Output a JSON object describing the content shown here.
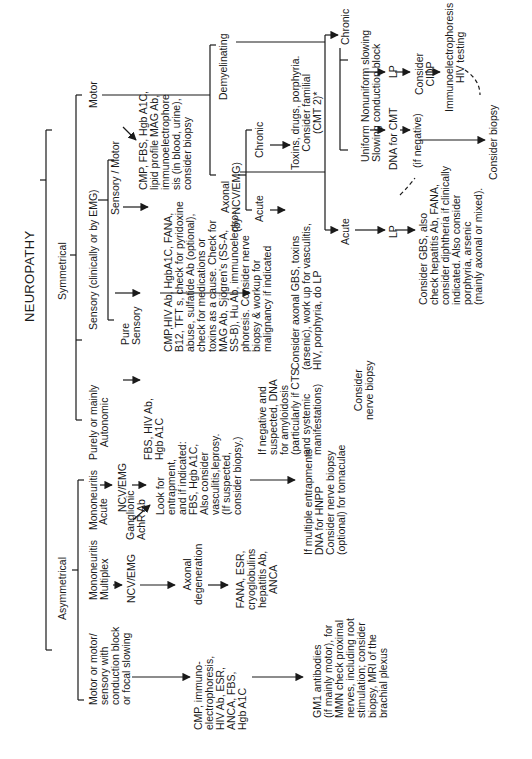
{
  "diagram": {
    "title": "NEUROPATHY",
    "branches": {
      "symmetrical": "Symmetrical",
      "asymmetrical": "Asymmetrical"
    },
    "symmetrical": {
      "motor": "Motor",
      "sensory": "Sensory (clinically or by EMG)",
      "autonomic": "Purely or mainly\nAutonomic",
      "sensory_motor": "Sensory / Motor",
      "pure_sensory": "Pure\nSensory",
      "sensory_motor_workup": "CMP, FBS, Hgb A1C,\nlipid profile MAG Ab,\nimmunoelectrophore\nsis (in blood, urine),\nconsider biopsy",
      "pure_sensory_workup": "CMP,HIV Ab, HgbA1C, FANA,\nB12, TFT s, check for pyridoxine\nabuse, sulfatide Ab (optional),\ncheck for medications or\ntoxins as a cause. Check for\nMAG Ab, Sjögren's (SS-A,\nSS-B), Hu Ab, immunoelectro-\nphoresis. Consider nerve\nbiopsy & workup for\nmalignancy if indicated",
      "autonomic_acute": "Acute",
      "ganglionic": "Ganglionic\nAchR Ab",
      "autonomic_workup": "FBS, HIV Ab,\nHgb A1C",
      "amyloid": "If negative and\nsuspected, DNA\nfor amyloidosis\n(particularly if CTS\nand systemic\nmanifestations)",
      "nerve_biopsy": "Consider\nnerve biopsy",
      "demyelinating": "Demyelinating",
      "axonal": "Axonal\n(by NCV/EMG)",
      "axonal_acute": "Acute",
      "axonal_chronic": "Chronic",
      "axonal_acute_workup": "Consider axonal GBS, toxins\n(arsenic), work up for vasculitis,\nHIV, porphyria, do LP",
      "axonal_chronic_workup": "Toxins, drugs, porphyria.\nConsider familial\n(CMT 2)*",
      "demy_chronic": "Chronic",
      "demy_acute": "Acute",
      "uniform_slowing": "Uniform\nSlowing",
      "nonuniform_slowing": "Nonuniform slowing\nconduction block",
      "dna_cmt": "DNA for CMT",
      "if_negative": "(if negative)",
      "lp_chronic": "LP",
      "consider_cidp": "Consider\nCIDP",
      "immunoelectrophoresis": "Immunoelectrophoresis\nHIV testing",
      "consider_biopsy": "Consider biopsy",
      "lp_acute": "LP",
      "gbs_workup": "Consider GBS, also\ncheck hepatitis Ab, FANA,\nconsider diphtheria if clinically\nindicated. Also consider\nporphyria, arsenic\n(mainly axonal or mixed)."
    },
    "asymmetrical": {
      "mononeuritis": "Mononeuritis",
      "mononeuritis_multiplex": "Mononeuritis\nMultiplex",
      "motor_focal": "Motor or motor/\nsensory with\nconduction block\nor focal slowing",
      "ncv_emg_1": "NCV/EMG",
      "ncv_emg_2": "NCV/EMG",
      "entrapment": "Look for\nentrapment,\nand if indicated:\nFBS, Hgb A1C,\nAlso consider\nvasculitis,leprosy.\n(If suspected,\nconsider biopsy.)",
      "hnpp": "If multiple entrapments\nDNA for HNPP\nConsider nerve biopsy\n(optional) for tomaculae",
      "axonal_degeneration": "Axonal\ndegeneration",
      "vasculitis_workup": "FANA, ESR,\ncryoglobulins\nhepatitis Ab,\nANCA",
      "motor_focal_workup": "CMP, immuno-\nelectrophoresis,\nHIV Ab, ESR,\nANCA, FBS,\nHgb A1C",
      "gm1": "GM1 antibodies\n(if mainly motor), for\nMMN check proximal\nnerves, including root\nstimulation; consider\nbiopsy, MRI of the\nbrachial plexus"
    },
    "colors": {
      "ink": "#1a1a1a",
      "paper": "#ffffff"
    }
  }
}
